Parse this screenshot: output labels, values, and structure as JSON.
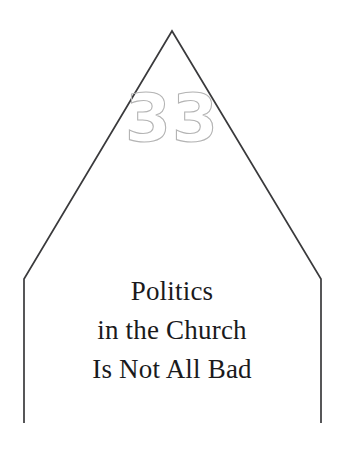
{
  "page": {
    "background_color": "#ffffff",
    "width": 344,
    "height": 453
  },
  "chapter_number": {
    "value": "33",
    "style": "outlined",
    "stroke_color": "#b4b4b4"
  },
  "chapter_title": {
    "lines": [
      "Politics",
      "in the Church",
      "Is Not All Bad"
    ],
    "color": "#1a1a1c"
  },
  "shape": {
    "name": "house-outline",
    "stroke_color": "#3a3a3c",
    "fill_color": "none",
    "points": {
      "apex": [
        172,
        31
      ],
      "left_corner": [
        24,
        279
      ],
      "right_corner": [
        321,
        279
      ],
      "left_bottom": [
        24,
        423
      ],
      "right_bottom": [
        321,
        423
      ]
    }
  }
}
